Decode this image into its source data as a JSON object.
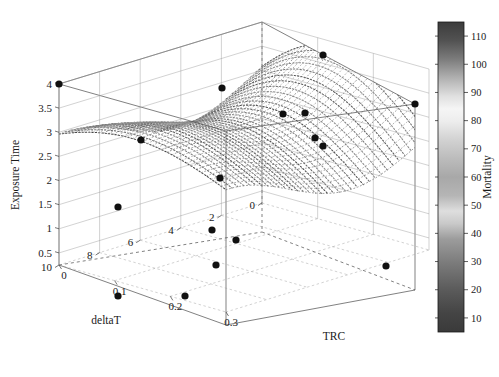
{
  "chart_data": {
    "type": "scatter",
    "subtype": "3d-scatter-with-surface",
    "title": "",
    "xlabel": "TRC",
    "ylabel": "deltaT",
    "zlabel": "Exposure Time",
    "x_ticks": [
      "0",
      "0.1",
      "0.2",
      "0.3"
    ],
    "x_tick_values": [
      0,
      0.1,
      0.2,
      0.3
    ],
    "y_ticks": [
      "10",
      "8",
      "6",
      "4",
      "2",
      "0"
    ],
    "y_tick_values": [
      10,
      8,
      6,
      4,
      2,
      0
    ],
    "z_ticks": [
      "0.5",
      "1",
      "1.5",
      "2",
      "2.5",
      "3",
      "3.5",
      "4"
    ],
    "z_tick_values": [
      0.5,
      1,
      1.5,
      2,
      2.5,
      3,
      3.5,
      4
    ],
    "xlim": [
      0,
      0.3
    ],
    "ylim": [
      0,
      10
    ],
    "zlim": [
      0.25,
      4
    ],
    "grid": true,
    "legend": "none",
    "colorbar": {
      "label": "Mortality",
      "ticks": [
        "10",
        "20",
        "30",
        "40",
        "50",
        "60",
        "70",
        "80",
        "90",
        "100",
        "110"
      ],
      "tick_values": [
        10,
        20,
        30,
        40,
        50,
        60,
        70,
        80,
        90,
        100,
        110
      ],
      "range": [
        5,
        115
      ],
      "colormap": "grayscale-nonmonotonic",
      "stops": [
        {
          "pos": 0.0,
          "color": "#3a3a3a"
        },
        {
          "pos": 0.06,
          "color": "#444444"
        },
        {
          "pos": 0.14,
          "color": "#5c5c5c"
        },
        {
          "pos": 0.22,
          "color": "#7a7a7a"
        },
        {
          "pos": 0.3,
          "color": "#9c9c9c"
        },
        {
          "pos": 0.35,
          "color": "#c9c9c9"
        },
        {
          "pos": 0.39,
          "color": "#dedede"
        },
        {
          "pos": 0.44,
          "color": "#b5b5b5"
        },
        {
          "pos": 0.5,
          "color": "#a8a8a8"
        },
        {
          "pos": 0.56,
          "color": "#bcbcbc"
        },
        {
          "pos": 0.62,
          "color": "#d2d2d2"
        },
        {
          "pos": 0.68,
          "color": "#ededed"
        },
        {
          "pos": 0.72,
          "color": "#f5f5f5"
        },
        {
          "pos": 0.76,
          "color": "#e0e0e0"
        },
        {
          "pos": 0.82,
          "color": "#b0b0b0"
        },
        {
          "pos": 0.88,
          "color": "#7c7c7c"
        },
        {
          "pos": 0.94,
          "color": "#525252"
        },
        {
          "pos": 1.0,
          "color": "#3c3c3c"
        }
      ]
    },
    "points": [
      {
        "trc": 0.0,
        "deltat": 10.0,
        "exposure": 4.0
      },
      {
        "trc": 0.22,
        "deltat": 10.0,
        "exposure": 4.0
      },
      {
        "trc": 0.17,
        "deltat": 7.5,
        "exposure": 3.6
      },
      {
        "trc": 0.3,
        "deltat": 7.0,
        "exposure": 3.2
      },
      {
        "trc": 0.09,
        "deltat": 5.5,
        "exposure": 3.1
      },
      {
        "trc": 0.13,
        "deltat": 5.5,
        "exposure": 3.0
      },
      {
        "trc": 0.18,
        "deltat": 4.2,
        "exposure": 2.8
      },
      {
        "trc": 0.2,
        "deltat": 3.4,
        "exposure": 2.6
      },
      {
        "trc": 0.055,
        "deltat": 6.0,
        "exposure": 2.6
      },
      {
        "trc": 0.055,
        "deltat": 5.2,
        "exposure": 1.95
      },
      {
        "trc": 0.25,
        "deltat": 2.5,
        "exposure": 1.9
      },
      {
        "trc": 0.02,
        "deltat": 4.8,
        "exposure": 1.25
      },
      {
        "trc": 0.09,
        "deltat": 3.6,
        "exposure": 0.95
      },
      {
        "trc": 0.135,
        "deltat": 3.0,
        "exposure": 0.75
      },
      {
        "trc": 0.09,
        "deltat": 2.0,
        "exposure": 0.45
      },
      {
        "trc": 0.24,
        "deltat": 1.2,
        "exposure": 0.45
      },
      {
        "trc": 0.045,
        "deltat": 6.0,
        "exposure": 0.28
      }
    ],
    "pixel_points": [
      {
        "cx": 59,
        "cy": 84
      },
      {
        "cx": 323,
        "cy": 55
      },
      {
        "cx": 415,
        "cy": 104
      },
      {
        "cx": 222,
        "cy": 88
      },
      {
        "cx": 283,
        "cy": 114
      },
      {
        "cx": 305,
        "cy": 113
      },
      {
        "cx": 315,
        "cy": 138
      },
      {
        "cx": 323,
        "cy": 146
      },
      {
        "cx": 141,
        "cy": 140
      },
      {
        "cx": 220,
        "cy": 178
      },
      {
        "cx": 386,
        "cy": 266
      },
      {
        "cx": 118,
        "cy": 207
      },
      {
        "cx": 212,
        "cy": 230
      },
      {
        "cx": 236,
        "cy": 240
      },
      {
        "cx": 216,
        "cy": 265
      },
      {
        "cx": 185,
        "cy": 296
      },
      {
        "cx": 118,
        "cy": 296
      }
    ]
  },
  "axes": {
    "z_title": "Exposure Time",
    "y_title": "deltaT",
    "x_title": "TRC"
  },
  "colorbar_title": "Mortality",
  "style": {
    "marker_color": "#101010",
    "axis_color": "#3d3d3d",
    "background": "#ffffff"
  }
}
